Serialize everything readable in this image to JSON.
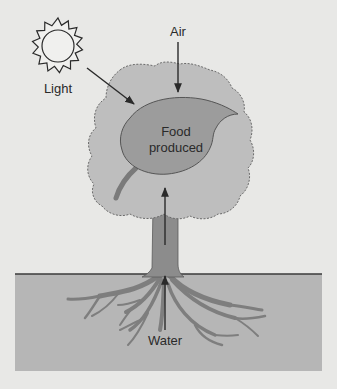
{
  "diagram": {
    "type": "photosynthesis-illustration",
    "labels": {
      "light": "Light",
      "air": "Air",
      "food_line1": "Food",
      "food_line2": "produced",
      "water": "Water"
    },
    "colors": {
      "background": "#e8e8e6",
      "canopy": "#bebebe",
      "leaf": "#9c9c9c",
      "trunk": "#8c8c8c",
      "ground": "#b6b6b6",
      "line": "#2a2a2a"
    }
  }
}
